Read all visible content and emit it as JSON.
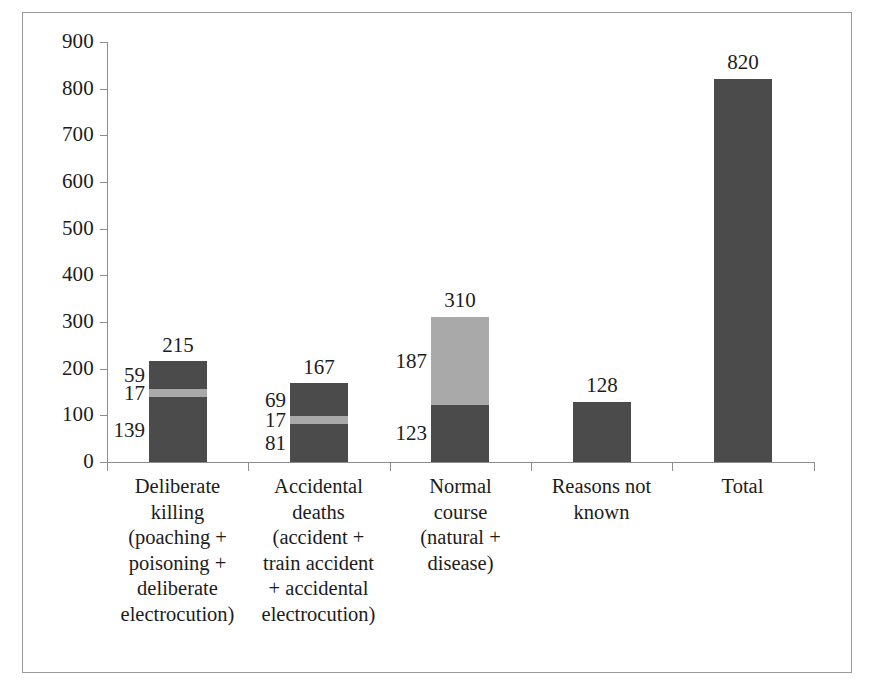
{
  "chart_data": {
    "type": "bar",
    "subtype": "stacked-bar",
    "title": "",
    "subtitle": "",
    "xlabel": "",
    "ylabel": "",
    "ylim": [
      0,
      900
    ],
    "ytick_step": 100,
    "ytick_labels": [
      "900",
      "800",
      "700",
      "600",
      "500",
      "400",
      "300",
      "200",
      "100",
      "0"
    ],
    "grid": false,
    "legend": "none",
    "colors": {
      "dark": "#4b4b4b",
      "light": "#a9a9a9",
      "axis": "#8d8d8d",
      "frame": "#9a9a9a",
      "text": "#1c1c1c",
      "background": "#ffffff"
    },
    "categories": [
      "Deliberate killing (poaching + poisoning + deliberate electrocution)",
      "Accidental deaths (accident + train accident + accidental electrocution)",
      "Normal course (natural + disease)",
      "Reasons not known",
      "Total"
    ],
    "category_label_lines": [
      [
        "Deliberate",
        "killing",
        "(poaching +",
        "poisoning +",
        "deliberate",
        "electrocution)"
      ],
      [
        "Accidental",
        "deaths",
        "(accident +",
        "train accident",
        "+ accidental",
        "electrocution)"
      ],
      [
        "Normal",
        "course",
        "(natural +",
        "disease)"
      ],
      [
        "Reasons not",
        "known"
      ],
      [
        "Total"
      ]
    ],
    "totals": [
      215,
      167,
      310,
      128,
      820
    ],
    "total_labels": [
      "215",
      "167",
      "310",
      "128",
      "820"
    ],
    "stacks": [
      {
        "category": "Deliberate killing (poaching + poisoning + deliberate electrocution)",
        "total": 215,
        "segments": [
          {
            "value": 139,
            "label": "139",
            "shade": "dark"
          },
          {
            "value": 17,
            "label": "17",
            "shade": "light"
          },
          {
            "value": 59,
            "label": "59",
            "shade": "dark"
          }
        ]
      },
      {
        "category": "Accidental deaths (accident + train accident + accidental electrocution)",
        "total": 167,
        "segments": [
          {
            "value": 81,
            "label": "81",
            "shade": "dark"
          },
          {
            "value": 17,
            "label": "17",
            "shade": "light"
          },
          {
            "value": 69,
            "label": "69",
            "shade": "dark"
          }
        ]
      },
      {
        "category": "Normal course (natural + disease)",
        "total": 310,
        "segments": [
          {
            "value": 123,
            "label": "123",
            "shade": "dark"
          },
          {
            "value": 187,
            "label": "187",
            "shade": "light"
          }
        ]
      },
      {
        "category": "Reasons not known",
        "total": 128,
        "segments": [
          {
            "value": 128,
            "label": "",
            "shade": "dark"
          }
        ]
      },
      {
        "category": "Total",
        "total": 820,
        "segments": [
          {
            "value": 820,
            "label": "",
            "shade": "dark"
          }
        ]
      }
    ]
  }
}
